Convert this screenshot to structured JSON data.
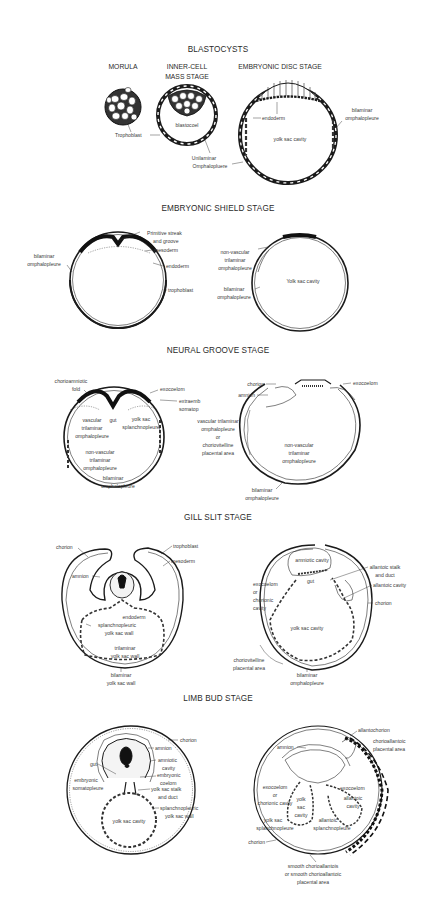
{
  "sections": {
    "blastocysts": {
      "title": "BLASTOCYSTS",
      "subtitles": [
        "MORULA",
        "INNER-CELL",
        "MASS STAGE",
        "EMBRYONIC DISC STAGE"
      ],
      "labels": {
        "trophoblast": "Trophoblast",
        "blastocoel": "blastocoel",
        "unilaminar_1": "Unilaminar",
        "unilaminar_2": "Omphalopluere",
        "endoderm": "endoderm",
        "yolk_sac_cavity": "yolk sac cavity",
        "bilaminar_1": "bilaminar",
        "bilaminar_2": "omphalopleure"
      }
    },
    "shield": {
      "title": "EMBRYONIC SHIELD STAGE",
      "labels": {
        "primitive_1": "Primitive streak",
        "primitive_2": "and groove",
        "mesoderm": "mesoderm",
        "endoderm": "endoderm",
        "trophoblast": "trophoblast",
        "bilaminar_1": "bilaminar",
        "bilaminar_2": "omphalopleure",
        "nonvasc_1": "non-vascular",
        "nonvasc_2": "trilaminar",
        "nonvasc_3": "omphalopleure",
        "yolk_sac_cavity": "Yolk sac cavity",
        "bilaminar_r1": "bilaminar",
        "bilaminar_r2": "omphalopleure"
      }
    },
    "neural": {
      "title": "NEURAL GROOVE STAGE",
      "labels": {
        "chorioamniotic_1": "chorioamniotic",
        "chorioamniotic_2": "fold",
        "exocoelom": "exocoelom",
        "extraemb_1": "extraemb",
        "extraemb_2": "somatop",
        "vascular_1": "vascular",
        "vascular_2": "trilaminar",
        "vascular_3": "omphalopleure",
        "gut": "gut",
        "yolk_sac_1": "yolk sac",
        "yolk_sac_2": "splanchnopleure",
        "nonvasc_1": "non-vascular",
        "nonvasc_2": "trilaminar",
        "nonvasc_3": "omphalopleure",
        "bilaminar_1": "bilaminar",
        "bilaminar_2": "omphalopleure",
        "chorion": "chorion",
        "amnion": "amnion",
        "exocoelom_r": "exocoelom",
        "vt_1": "vascular trilaminar",
        "vt_2": "omphalopleure",
        "vt_3": "or",
        "vt_4": "choriovitelline",
        "vt_5": "placental area",
        "nonvasc_r1": "non-vascular",
        "nonvasc_r2": "trilaminar",
        "nonvasc_r3": "omphalopleure",
        "bilaminar_r1": "bilaminar",
        "bilaminar_r2": "omphalopleure"
      }
    },
    "gill": {
      "title": "GILL SLIT STAGE",
      "labels": {
        "chorion": "chorion",
        "trophoblast": "trophoblast",
        "mesoderm": "mesoderm",
        "amnion": "amnion",
        "endoderm": "endoderm",
        "splanch_1": "splanchnopleuric",
        "splanch_2": "yolk sac wall",
        "tri_1": "trilaminar",
        "tri_2": "yolk sac wall",
        "bil_1": "bilaminar",
        "bil_2": "yolk sac wall",
        "amniotic_cavity": "amniotic cavity",
        "gut": "gut",
        "allantoic_stalk_1": "allantoic stalk",
        "allantoic_stalk_2": "and duct",
        "allantoic_cavity": "allantoic cavity",
        "chorion_r": "chorion",
        "exo_1": "exocoelom",
        "exo_2": "or",
        "exo_3": "chorionic",
        "exo_4": "cavity",
        "yolk_sac_cavity": "yolk sac cavity",
        "cv_1": "choriovitelline",
        "cv_2": "placental area",
        "bil_r1": "bilaminar",
        "bil_r2": "omphalopleure"
      }
    },
    "limb": {
      "title": "LIMB BUD STAGE",
      "labels": {
        "chorion": "chorion",
        "amnion": "amnion",
        "amniotic_1": "amniotic",
        "amniotic_2": "cavity",
        "gut": "gut",
        "emb_coel_1": "embryonic",
        "emb_coel_2": "coelom",
        "emb_som_1": "embryonic",
        "emb_som_2": "somatopleure",
        "ys_stalk_1": "yolk sac stalk",
        "ys_stalk_2": "and duct",
        "splanch_1": "splanchnopleuric",
        "splanch_2": "yolk sac wall",
        "yolk_sac_cavity": "yolk sac cavity",
        "allantochorion": "allantochorion",
        "ca_1": "chorioallantoic",
        "ca_2": "placental area",
        "amnion_r": "amnion",
        "exo_l1": "exocoelom",
        "exo_l2": "or",
        "exo_l3": "chorionic cavity",
        "exo_r": "exocoelom",
        "ysc_1": "yolk",
        "ysc_2": "sac",
        "ysc_3": "cavity",
        "all_cav_1": "allantoic",
        "all_cav_2": "cavity",
        "ys_spl_1": "yolk sac",
        "ys_spl_2": "splanchnopleure",
        "all_spl_1": "allantoic",
        "all_spl_2": "splanchnopleure",
        "chorion_r": "chorion",
        "smooth_1": "smooth chorioallantois",
        "smooth_2": "or smooth chorioallantoic",
        "smooth_3": "placental area"
      }
    }
  }
}
